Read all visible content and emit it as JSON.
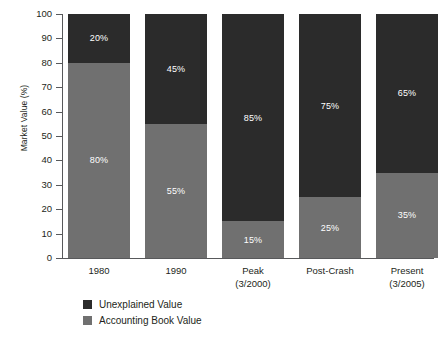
{
  "chart_data": {
    "type": "bar",
    "subtype": "stacked-100-percent",
    "title": "",
    "xlabel": "",
    "ylabel": "Market Value (%)",
    "ylim": [
      0,
      100
    ],
    "ytick_step": 10,
    "yticks": [
      100,
      90,
      80,
      70,
      60,
      50,
      40,
      30,
      20,
      10,
      0
    ],
    "grid": false,
    "legend_position": "bottom-left",
    "categories": [
      "1980",
      "1990",
      "Peak",
      "Post-Crash",
      "Present"
    ],
    "category_sublabels": [
      "",
      "",
      "(3/2000)",
      "",
      "(3/2005)"
    ],
    "series": [
      {
        "name": "Unexplained Value",
        "color": "#2b2b2b",
        "values": [
          20,
          45,
          85,
          75,
          65
        ],
        "labels": [
          "20%",
          "45%",
          "85%",
          "75%",
          "65%"
        ]
      },
      {
        "name": "Accounting Book Value",
        "color": "#707070",
        "values": [
          80,
          55,
          15,
          25,
          35
        ],
        "labels": [
          "80%",
          "55%",
          "15%",
          "25%",
          "35%"
        ]
      }
    ]
  },
  "axis": {
    "y_title": "Market Value (%)",
    "tick_labels": [
      "100",
      "90",
      "80",
      "70",
      "60",
      "50",
      "40",
      "30",
      "20",
      "10",
      "0"
    ]
  },
  "legend": {
    "items": [
      {
        "label": "Unexplained Value",
        "color": "#2b2b2b"
      },
      {
        "label": "Accounting Book Value",
        "color": "#707070"
      }
    ]
  },
  "colors": {
    "unexplained": "#2b2b2b",
    "book_value": "#707070",
    "axis": "#58595b",
    "text": "#231f20",
    "background": "#ffffff",
    "label_text": "#ffffff"
  }
}
